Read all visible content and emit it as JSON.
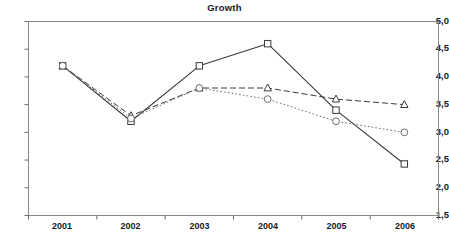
{
  "chart_data": {
    "type": "line",
    "title": "Growth",
    "xlabel": "",
    "ylabel": "",
    "categories": [
      "2001",
      "2002",
      "2003",
      "2004",
      "2005",
      "2006"
    ],
    "ylim": [
      1.5,
      5.0
    ],
    "ytick_labels": [
      "5,0",
      "4,5",
      "4,0",
      "3,5",
      "3,0",
      "2,5",
      "2,0",
      "1,5"
    ],
    "ytick_values": [
      5.0,
      4.5,
      4.0,
      3.5,
      3.0,
      2.5,
      2.0,
      1.5
    ],
    "grid": false,
    "legend": "none",
    "decimal_separator": ",",
    "series": [
      {
        "name": "series-square-solid",
        "marker": "square",
        "line_style": "solid",
        "color": "#3a3a3a",
        "values": [
          4.2,
          3.2,
          4.2,
          4.6,
          3.4,
          2.43
        ]
      },
      {
        "name": "series-triangle-dashed",
        "marker": "triangle",
        "line_style": "dashed",
        "color": "#3a3a3a",
        "values": [
          4.2,
          3.3,
          3.8,
          3.8,
          3.6,
          3.5
        ]
      },
      {
        "name": "series-circle-dotted",
        "marker": "circle",
        "line_style": "dotted",
        "color": "#6e6e6e",
        "values": [
          4.2,
          3.25,
          3.8,
          3.6,
          3.2,
          3.0
        ]
      }
    ]
  },
  "axis": {
    "frame_color": "#8a8a8a",
    "tick_color": "#6a6a6a"
  }
}
